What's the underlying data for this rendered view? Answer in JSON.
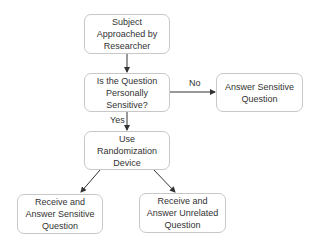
{
  "nodes": {
    "start": "Subject Approached by Researcher",
    "decision": "Is the Question Personally Sensitive?",
    "answer_direct": "Answer Sensitive Question",
    "randomize": "Use Randomization Device",
    "sensitive": "Receive and Answer Sensitive Question",
    "unrelated": "Receive and Answer Unrelated Question"
  },
  "edges": {
    "no": "No",
    "yes": "Yes"
  },
  "colors": {
    "border": "#c8c8c8",
    "arrow": "#333333",
    "text": "#333333"
  }
}
